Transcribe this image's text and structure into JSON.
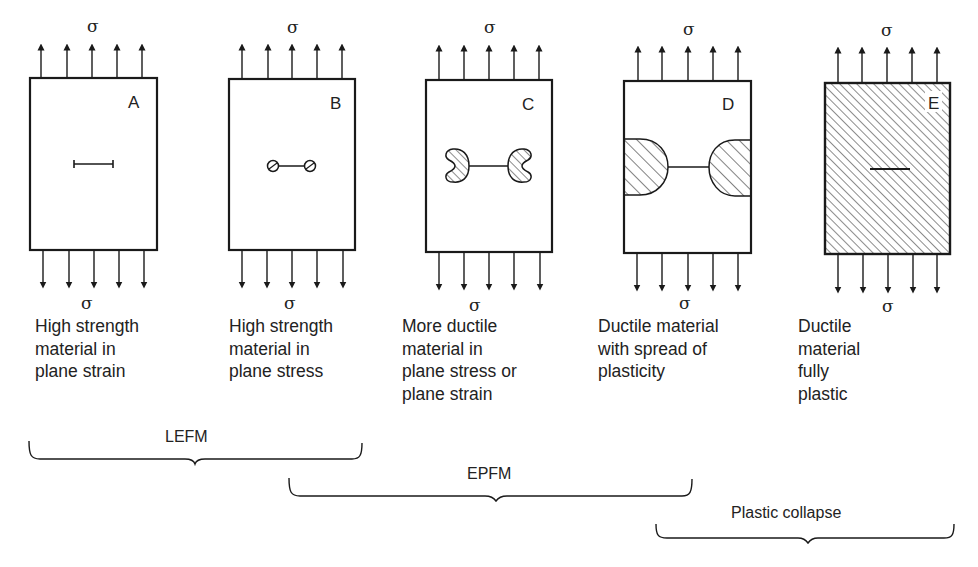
{
  "figure": {
    "stress_symbol": "σ",
    "panels": [
      {
        "id": "A",
        "letter": "A",
        "caption": [
          "High strength",
          "material in",
          "plane strain"
        ],
        "crack_tip_type": "sharp crack, minimal plasticity"
      },
      {
        "id": "B",
        "letter": "B",
        "caption": [
          "High strength",
          "material in",
          "plane stress"
        ],
        "crack_tip_type": "small circular plastic zones"
      },
      {
        "id": "C",
        "letter": "C",
        "caption": [
          "More ductile",
          "material in",
          "plane stress or",
          "plane strain"
        ],
        "crack_tip_type": "butterfly-shaped plastic zones"
      },
      {
        "id": "D",
        "letter": "D",
        "caption": [
          "Ductile material",
          "with spread of",
          "plasticity"
        ],
        "crack_tip_type": "large plastic zones reaching edges"
      },
      {
        "id": "E",
        "letter": "E",
        "caption": [
          "Ductile",
          "material",
          "fully",
          "plastic"
        ],
        "crack_tip_type": "entire section hatched (fully plastic)"
      }
    ],
    "braces": [
      {
        "id": "lefm",
        "label": "LEFM",
        "spans": [
          "A",
          "B"
        ]
      },
      {
        "id": "epfm",
        "label": "EPFM",
        "spans": [
          "B",
          "C",
          "D"
        ]
      },
      {
        "id": "plastic-collapse",
        "label": "Plastic collapse",
        "spans": [
          "D",
          "E"
        ]
      }
    ]
  },
  "colors": {
    "line": "#1a1a1a",
    "background": "#ffffff"
  }
}
